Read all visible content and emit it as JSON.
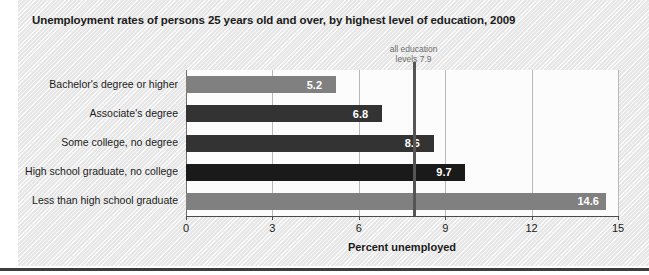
{
  "chart_data": {
    "type": "bar",
    "orientation": "horizontal",
    "title": "Unemployment rates of persons 25 years old and over, by highest level of education, 2009",
    "xlabel": "Percent unemployed",
    "ylabel": "",
    "xlim": [
      0,
      15
    ],
    "xticks": [
      "0",
      "3",
      "6",
      "9",
      "12",
      "15"
    ],
    "xtick_values": [
      0,
      3,
      6,
      9,
      12,
      15
    ],
    "grid": true,
    "legend": "none",
    "categories": [
      "Bachelor's degree or higher",
      "Associate's degree",
      "Some college, no degree",
      "High school graduate, no college",
      "Less than high school graduate"
    ],
    "values": [
      5.2,
      6.8,
      8.6,
      9.7,
      14.6
    ],
    "value_labels": [
      "5.2",
      "6.8",
      "8.6",
      "9.7",
      "14.6"
    ],
    "bar_colors": [
      "#808080",
      "#333333",
      "#333333",
      "#1a1a1a",
      "#808080"
    ],
    "annotation": {
      "line1": "all education",
      "line2": "levels 7.9",
      "value": 7.9,
      "color": "#555555"
    }
  },
  "colors": {
    "panel_background": "#f0f0f0",
    "plot_background": "#fcfcfc",
    "gridline": "#b9b9b9",
    "axis": "#4a4a4a",
    "text": "#1b1b1b",
    "annotation_text": "#6b6b6b",
    "value_label_text": "#ffffff",
    "bottom_rule": "#3d3d3d"
  }
}
